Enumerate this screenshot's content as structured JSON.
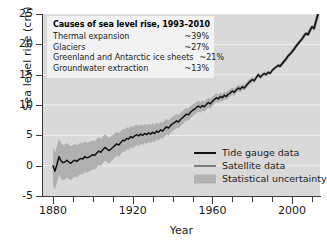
{
  "chart_data": {
    "type": "line",
    "title": "",
    "xlabel": "Year",
    "ylabel": "Sea level rise (cm)",
    "xlim": [
      1875,
      2014
    ],
    "ylim": [
      -5,
      25
    ],
    "grid": true,
    "grid_orientation": "horizontal",
    "xticks": [
      1880,
      1890,
      1900,
      1910,
      1920,
      1930,
      1940,
      1950,
      1960,
      1970,
      1980,
      1990,
      2000,
      2010
    ],
    "xtick_labels": [
      "1880",
      "",
      "",
      "",
      "1920",
      "",
      "",
      "",
      "1960",
      "",
      "",
      "",
      "2000",
      ""
    ],
    "yticks": [
      -5,
      0,
      5,
      10,
      15,
      20,
      25
    ],
    "ytick_labels": [
      "-5",
      "0",
      "5",
      "10",
      "15",
      "20",
      "25"
    ],
    "legend_position": "lower right",
    "colors": {
      "tide_gauge_line": "#111111",
      "satellite_line": "#7d7d7d",
      "uncertainty_band": "#a8a8a8",
      "plot_background": "#d9d9d9",
      "gridline": "#efefef",
      "axis": "#3a3a3a"
    },
    "series": [
      {
        "name": "Tide gauge data",
        "style": "line",
        "x": [
          1880,
          1881,
          1882,
          1883,
          1884,
          1885,
          1886,
          1887,
          1888,
          1889,
          1890,
          1891,
          1892,
          1893,
          1894,
          1895,
          1896,
          1897,
          1898,
          1899,
          1900,
          1901,
          1902,
          1903,
          1904,
          1905,
          1906,
          1907,
          1908,
          1909,
          1910,
          1911,
          1912,
          1913,
          1914,
          1915,
          1916,
          1917,
          1918,
          1919,
          1920,
          1921,
          1922,
          1923,
          1924,
          1925,
          1926,
          1927,
          1928,
          1929,
          1930,
          1931,
          1932,
          1933,
          1934,
          1935,
          1936,
          1937,
          1938,
          1939,
          1940,
          1941,
          1942,
          1943,
          1944,
          1945,
          1946,
          1947,
          1948,
          1949,
          1950,
          1951,
          1952,
          1953,
          1954,
          1955,
          1956,
          1957,
          1958,
          1959,
          1960,
          1961,
          1962,
          1963,
          1964,
          1965,
          1966,
          1967,
          1968,
          1969,
          1970,
          1971,
          1972,
          1973,
          1974,
          1975,
          1976,
          1977,
          1978,
          1979,
          1980,
          1981,
          1982,
          1983,
          1984,
          1985,
          1986,
          1987,
          1988,
          1989,
          1990,
          1991,
          1992,
          1993,
          1994,
          1995,
          1996,
          1997,
          1998,
          1999,
          2000,
          2001,
          2002,
          2003,
          2004,
          2005,
          2006,
          2007,
          2008,
          2009,
          2010,
          2011,
          2012,
          2013
        ],
        "y": [
          0.0,
          -0.9,
          0.2,
          1.5,
          0.8,
          0.5,
          0.6,
          0.9,
          0.6,
          0.4,
          0.7,
          0.9,
          0.7,
          1.0,
          1.2,
          1.1,
          1.5,
          1.3,
          1.4,
          1.6,
          1.8,
          1.7,
          2.1,
          2.4,
          2.2,
          2.6,
          3.0,
          2.8,
          2.5,
          2.7,
          3.0,
          3.3,
          3.6,
          3.4,
          3.8,
          4.2,
          4.1,
          4.5,
          4.4,
          4.8,
          4.6,
          4.9,
          5.1,
          4.9,
          5.2,
          5.0,
          5.3,
          5.1,
          5.4,
          5.2,
          5.5,
          5.3,
          5.7,
          5.5,
          5.9,
          5.7,
          6.1,
          6.4,
          6.2,
          6.6,
          6.9,
          7.1,
          7.4,
          7.2,
          7.6,
          7.9,
          8.2,
          8.5,
          8.4,
          8.8,
          9.1,
          9.3,
          9.6,
          9.8,
          9.6,
          9.9,
          9.7,
          10.1,
          10.4,
          10.2,
          10.6,
          10.9,
          11.2,
          11.0,
          11.4,
          11.2,
          11.6,
          11.4,
          11.8,
          12.0,
          12.3,
          12.1,
          12.5,
          12.8,
          12.6,
          13.0,
          12.8,
          13.2,
          13.6,
          13.9,
          14.2,
          14.0,
          14.5,
          15.0,
          14.6,
          14.9,
          15.2,
          15.0,
          15.4,
          15.2,
          15.7,
          16.0,
          16.3,
          16.5,
          16.4,
          16.8,
          17.2,
          17.6,
          18.1,
          18.4,
          18.8,
          19.2,
          19.7,
          20.1,
          20.5,
          20.9,
          21.4,
          21.8,
          21.6,
          22.3,
          22.9,
          22.6,
          23.8,
          25.0
        ]
      },
      {
        "name": "Satellite data",
        "style": "line",
        "note": "overlaps tide gauge record from 1993 onward"
      },
      {
        "name": "Statistical uncertainty",
        "style": "band",
        "note": "shaded envelope, widest near 1880 (about +/-3 cm) narrowing to near zero by 2013"
      }
    ],
    "annotation": {
      "title": "Causes of sea level rise, 1993–2010",
      "rows": [
        {
          "cause": "Thermal expansion",
          "value": "~39%"
        },
        {
          "cause": "Glaciers",
          "value": "~27%"
        },
        {
          "cause": "Greenland and Antarctic ice sheets",
          "value": "~21%"
        },
        {
          "cause": "Groundwater extraction",
          "value": "~13%"
        }
      ]
    },
    "legend": [
      {
        "label": "Tide gauge data",
        "marker": "line-black"
      },
      {
        "label": "Satellite data",
        "marker": "line-gray"
      },
      {
        "label": "Statistical uncertainty",
        "marker": "band-gray"
      }
    ]
  }
}
